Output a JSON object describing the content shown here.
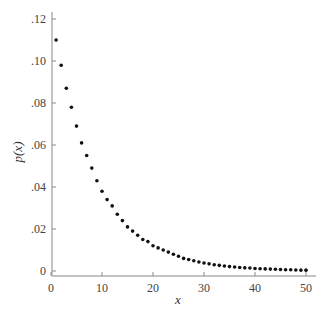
{
  "chart_data": {
    "type": "scatter",
    "title": "",
    "xlabel": "x",
    "ylabel": "p(x)",
    "xlim": [
      0,
      51
    ],
    "ylim": [
      -0.002,
      0.123
    ],
    "grid": false,
    "legend": null,
    "x_ticks": [
      0,
      10,
      20,
      30,
      40,
      50
    ],
    "x_tick_labels": [
      "0",
      "10",
      "20",
      "30",
      "40",
      "50"
    ],
    "y_ticks": [
      0,
      0.02,
      0.04,
      0.06,
      0.08,
      0.1,
      0.12
    ],
    "y_tick_labels": [
      "0",
      ".02",
      ".04",
      ".06",
      ".08",
      ".10",
      ".12"
    ],
    "series": [
      {
        "name": "p(x)",
        "marker": "dot",
        "color": "#111111",
        "x": [
          1,
          2,
          3,
          4,
          5,
          6,
          7,
          8,
          9,
          10,
          11,
          12,
          13,
          14,
          15,
          16,
          17,
          18,
          19,
          20,
          21,
          22,
          23,
          24,
          25,
          26,
          27,
          28,
          29,
          30,
          31,
          32,
          33,
          34,
          35,
          36,
          37,
          38,
          39,
          40,
          41,
          42,
          43,
          44,
          45,
          46,
          47,
          48,
          49,
          50
        ],
        "y": [
          0.11,
          0.098,
          0.087,
          0.078,
          0.069,
          0.061,
          0.055,
          0.049,
          0.043,
          0.038,
          0.034,
          0.031,
          0.027,
          0.024,
          0.021,
          0.019,
          0.017,
          0.015,
          0.014,
          0.012,
          0.011,
          0.01,
          0.009,
          0.008,
          0.007,
          0.006,
          0.0055,
          0.0049,
          0.0043,
          0.0038,
          0.0034,
          0.003,
          0.0027,
          0.0024,
          0.0021,
          0.0019,
          0.0017,
          0.0015,
          0.0014,
          0.0012,
          0.0011,
          0.001,
          0.0009,
          0.0008,
          0.0007,
          0.0006,
          0.0006,
          0.0005,
          0.0004,
          0.0004
        ]
      }
    ]
  },
  "layout": {
    "plot": {
      "x0_px": 51,
      "x1_px": 306,
      "y0_px": 271,
      "y1_px": 19,
      "axis_y_px": 276,
      "axis_x_px": 52
    }
  },
  "colors": {
    "axis": "#888888",
    "point": "#111111",
    "text": "#444444"
  }
}
